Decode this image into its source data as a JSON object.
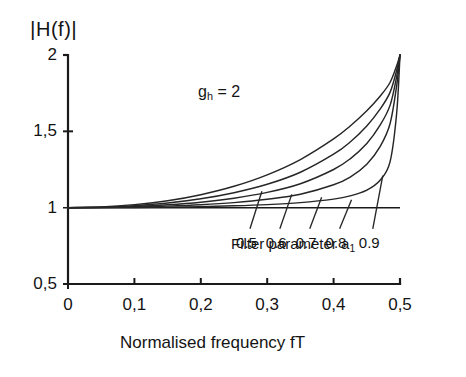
{
  "figure": {
    "y_axis_title": "H(f)",
    "y_axis_title_bars": "|",
    "x_axis_title": "Normalised frequency fT",
    "annotation": "g",
    "annotation_sub": "h",
    "annotation_rest": " = 2",
    "legend_caption_main": "Filter parameter a",
    "legend_caption_sub": "1"
  },
  "chart_data": {
    "type": "line",
    "title": "",
    "xlabel": "Normalised frequency fT",
    "ylabel": "|H(f)|",
    "xlim": [
      0,
      0.5
    ],
    "ylim": [
      0.5,
      2
    ],
    "xticks": [
      0,
      0.1,
      0.2,
      0.3,
      0.4,
      0.5
    ],
    "xticklabels": [
      "0",
      "0,1",
      "0,2",
      "0,3",
      "0,4",
      "0,5"
    ],
    "yticks": [
      0.5,
      1,
      1.5,
      2
    ],
    "yticklabels": [
      "0,5",
      "1",
      "1,5",
      "2"
    ],
    "grid": false,
    "legend_position": "inline-leader-lines",
    "annotations": [
      {
        "text": "g_h = 2",
        "x": 0.22,
        "y": 1.78
      },
      {
        "text": "Filter parameter a_1",
        "x": 0.3,
        "y": 0.82
      }
    ],
    "series": [
      {
        "name": "0.5",
        "label": "0.5",
        "x": [
          0,
          0.05,
          0.1,
          0.15,
          0.2,
          0.25,
          0.3,
          0.35,
          0.4,
          0.425,
          0.45,
          0.47,
          0.485,
          0.495,
          0.5
        ],
        "values": [
          1.0,
          1.005,
          1.02,
          1.045,
          1.085,
          1.14,
          1.215,
          1.315,
          1.45,
          1.535,
          1.635,
          1.73,
          1.82,
          1.93,
          2.0
        ]
      },
      {
        "name": "0.6",
        "label": "0.6",
        "x": [
          0,
          0.05,
          0.1,
          0.15,
          0.2,
          0.25,
          0.3,
          0.35,
          0.4,
          0.425,
          0.45,
          0.47,
          0.485,
          0.495,
          0.5
        ],
        "values": [
          1.0,
          1.003,
          1.013,
          1.03,
          1.058,
          1.098,
          1.153,
          1.232,
          1.35,
          1.43,
          1.535,
          1.645,
          1.755,
          1.9,
          2.0
        ]
      },
      {
        "name": "0.7",
        "label": "0.7",
        "x": [
          0,
          0.05,
          0.1,
          0.15,
          0.2,
          0.25,
          0.3,
          0.35,
          0.4,
          0.425,
          0.45,
          0.47,
          0.485,
          0.495,
          0.5
        ],
        "values": [
          1.0,
          1.002,
          1.008,
          1.019,
          1.036,
          1.062,
          1.1,
          1.157,
          1.25,
          1.32,
          1.42,
          1.54,
          1.67,
          1.86,
          2.0
        ]
      },
      {
        "name": "0.8",
        "label": "0.8",
        "x": [
          0,
          0.05,
          0.1,
          0.15,
          0.2,
          0.25,
          0.3,
          0.35,
          0.4,
          0.425,
          0.45,
          0.47,
          0.485,
          0.495,
          0.5
        ],
        "values": [
          1.0,
          1.001,
          1.004,
          1.01,
          1.019,
          1.033,
          1.055,
          1.088,
          1.15,
          1.2,
          1.285,
          1.4,
          1.55,
          1.8,
          2.0
        ]
      },
      {
        "name": "0.9",
        "label": "0.9",
        "x": [
          0,
          0.05,
          0.1,
          0.15,
          0.2,
          0.25,
          0.3,
          0.35,
          0.4,
          0.425,
          0.45,
          0.47,
          0.485,
          0.495,
          0.5
        ],
        "values": [
          1.0,
          1.0004,
          1.0015,
          1.0035,
          1.007,
          1.012,
          1.02,
          1.033,
          1.056,
          1.077,
          1.115,
          1.18,
          1.3,
          1.62,
          2.0
        ]
      }
    ],
    "curve_labels": [
      {
        "text": "0.5",
        "lx": 0.262,
        "ly": 0.77,
        "px": 0.292,
        "py": 1.108
      },
      {
        "text": "0.6",
        "lx": 0.307,
        "ly": 0.77,
        "px": 0.337,
        "py": 1.087
      },
      {
        "text": "0.7",
        "lx": 0.352,
        "ly": 0.77,
        "px": 0.382,
        "py": 1.068
      },
      {
        "text": "0.8",
        "lx": 0.397,
        "ly": 0.77,
        "px": 0.427,
        "py": 1.052
      },
      {
        "text": "0.9",
        "lx": 0.447,
        "ly": 0.77,
        "px": 0.474,
        "py": 1.21
      }
    ],
    "colors": {
      "axis": "#1a1a1a",
      "curve": "#262626",
      "background": "#ffffff"
    }
  }
}
